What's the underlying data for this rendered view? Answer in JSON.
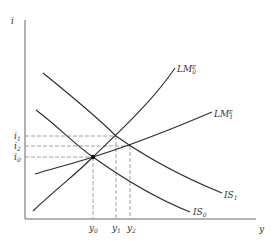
{
  "diagram": {
    "type": "IS-LM diagram",
    "axes": {
      "y_axis_label": "i",
      "x_axis_label": "y"
    },
    "interest_levels": [
      {
        "label": "i",
        "sub": "1",
        "y": 136
      },
      {
        "label": "i",
        "sub": "2",
        "y": 146
      },
      {
        "label": "i",
        "sub": "0",
        "y": 157
      }
    ],
    "output_levels": [
      {
        "label": "y",
        "sub": "0",
        "x": 93
      },
      {
        "label": "y",
        "sub": "1",
        "x": 116
      },
      {
        "label": "y",
        "sub": "2",
        "x": 130
      }
    ],
    "curves": [
      {
        "name": "LM",
        "sub": "0",
        "sup": "E",
        "kind": "LM"
      },
      {
        "name": "LM",
        "sub": "1",
        "sup": "E",
        "kind": "LM"
      },
      {
        "name": "IS",
        "sub": "1",
        "kind": "IS"
      },
      {
        "name": "IS",
        "sub": "0",
        "kind": "IS"
      }
    ],
    "colors": {
      "line": "#2a2a2a",
      "axis": "#555555",
      "dashed": "#888888",
      "text": "#333333"
    }
  }
}
